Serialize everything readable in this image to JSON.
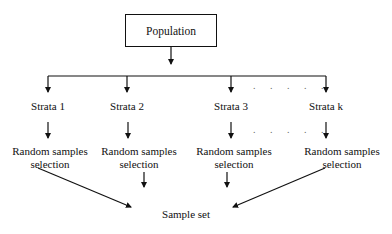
{
  "diagram": {
    "root": {
      "label": "Population"
    },
    "strata": [
      {
        "label": "Strata 1",
        "step": "Random samples selection",
        "step_line1": "Random samples",
        "step_line2": "selection"
      },
      {
        "label": "Strata 2",
        "step": "Random samples selection",
        "step_line1": "Random samples",
        "step_line2": "selection"
      },
      {
        "label": "Strata 3",
        "step": "Random samples selection",
        "step_line1": "Random samples",
        "step_line2": "selection"
      },
      {
        "label": "Strata k",
        "step": "Random samples selection",
        "step_line1": "Random samples",
        "step_line2": "selection"
      }
    ],
    "ellipsis": ". . . . .",
    "sink": {
      "label": "Sample set"
    }
  }
}
